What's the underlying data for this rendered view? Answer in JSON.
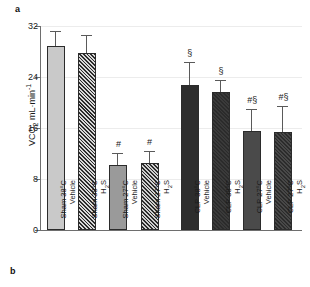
{
  "panels": {
    "a_label": "a",
    "b_label": "b"
  },
  "chart_data": {
    "type": "bar",
    "title": "",
    "xlabel": "",
    "ylabel": "VCO2 mL·min-1",
    "ylabel_parts": {
      "base": "VCO",
      "sub": "2",
      "tail": " mL·min",
      "sup": "-1"
    },
    "ylim": [
      0,
      32
    ],
    "yticks": [
      0,
      8,
      16,
      24,
      32
    ],
    "ytick_labels": [
      "0",
      "8",
      "16",
      "24",
      "32"
    ],
    "grid": true,
    "legend": "none",
    "categories": [
      "Sham 38°C Vehicle",
      "Sham 38°C H2S",
      "Sham 27°C Vehicle",
      "Sham 27°C H2S",
      "CLP 38°C Vehicle",
      "CLP 38°C H2S",
      "CLP 27°C Vehicle",
      "CLP 27°C H2S"
    ],
    "values": [
      28.8,
      27.8,
      10.2,
      10.5,
      22.7,
      21.6,
      15.5,
      15.3
    ],
    "errors": [
      2.3,
      2.6,
      1.8,
      1.7,
      3.5,
      1.7,
      3.3,
      4.0
    ],
    "annotations": [
      "",
      "",
      "#",
      "#",
      "§",
      "§",
      "#§",
      "#§"
    ],
    "bars": [
      {
        "category": "Sham 38°C Vehicle",
        "label_line1": "Sham 38°C",
        "label_line2": "Vehicle",
        "value": 28.8,
        "error": 2.3,
        "marker": "",
        "fill": "#c9c9c9",
        "hatch": false
      },
      {
        "category": "Sham 38°C H2S",
        "label_line1": "Sham 38°C",
        "label_line2": "H2S",
        "value": 27.8,
        "error": 2.6,
        "marker": "",
        "fill": "#d7d7d7",
        "hatch": true
      },
      {
        "category": "Sham 27°C Vehicle",
        "label_line1": "Sham 27°C",
        "label_line2": "Vehicle",
        "value": 10.2,
        "error": 1.8,
        "marker": "#",
        "fill": "#9a9a9a",
        "hatch": false
      },
      {
        "category": "Sham 27°C H2S",
        "label_line1": "Sham 27°C",
        "label_line2": "H2S",
        "value": 10.5,
        "error": 1.7,
        "marker": "#",
        "fill": "#cfcfcf",
        "hatch": true
      },
      {
        "category": "CLP 38°C Vehicle",
        "label_line1": "CLP 38°C",
        "label_line2": "Vehicle",
        "value": 22.7,
        "error": 3.5,
        "marker": "§",
        "fill": "#2d2d2d",
        "hatch": false
      },
      {
        "category": "CLP 38°C H2S",
        "label_line1": "CLP 38°C",
        "label_line2": "H2S",
        "value": 21.6,
        "error": 1.7,
        "marker": "§",
        "fill": "#3a3a3a",
        "hatch": true
      },
      {
        "category": "CLP 27°C Vehicle",
        "label_line1": "CLP 27°C",
        "label_line2": "Vehicle",
        "value": 15.5,
        "error": 3.3,
        "marker": "#§",
        "fill": "#4a4a4a",
        "hatch": false
      },
      {
        "category": "CLP 27°C H2S",
        "label_line1": "CLP 27°C",
        "label_line2": "H2S",
        "value": 15.3,
        "error": 4.0,
        "marker": "#§",
        "fill": "#484848",
        "hatch": true
      }
    ]
  },
  "colors": {
    "axis": "#6e6e6e",
    "grid": "#ececec",
    "text": "#1a1a1a",
    "error": "#5a5a5a",
    "bar_edge": "#2b2b2b"
  }
}
